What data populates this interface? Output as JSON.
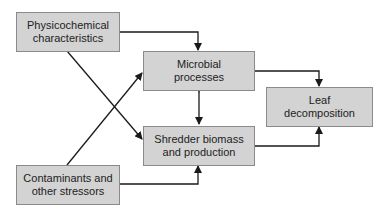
{
  "diagram": {
    "nodes": [
      {
        "id": "physicochemical",
        "label": "Physicochemical characteristics"
      },
      {
        "id": "microbial",
        "label": "Microbial processes"
      },
      {
        "id": "leaf",
        "label": "Leaf decomposition"
      },
      {
        "id": "shredder",
        "label": "Shredder biomass and production"
      },
      {
        "id": "contaminants",
        "label": "Contaminants and other stressors"
      }
    ],
    "edges": [
      {
        "from": "physicochemical",
        "to": "microbial"
      },
      {
        "from": "physicochemical",
        "to": "shredder"
      },
      {
        "from": "contaminants",
        "to": "microbial"
      },
      {
        "from": "contaminants",
        "to": "shredder"
      },
      {
        "from": "microbial",
        "to": "shredder",
        "bidirectional": true
      },
      {
        "from": "microbial",
        "to": "leaf"
      },
      {
        "from": "shredder",
        "to": "leaf"
      }
    ],
    "colors": {
      "box_fill": "#d3d3d3",
      "box_border": "#8a8a8a",
      "line": "#1a1a1a"
    }
  }
}
